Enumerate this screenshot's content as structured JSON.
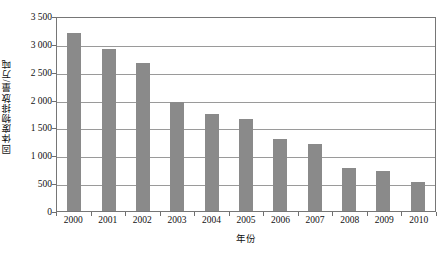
{
  "chart_data": {
    "type": "bar",
    "title": "",
    "xlabel": "年份",
    "ylabel": "固体废物排放量/万吨",
    "categories": [
      "2000",
      "2001",
      "2002",
      "2003",
      "2004",
      "2005",
      "2006",
      "2007",
      "2008",
      "2009",
      "2010"
    ],
    "values": [
      3200,
      2900,
      2650,
      1950,
      1750,
      1650,
      1300,
      1200,
      780,
      720,
      520
    ],
    "series": [
      {
        "name": "固体废物排放量",
        "values": [
          3200,
          2900,
          2650,
          1950,
          1750,
          1650,
          1300,
          1200,
          780,
          720,
          520
        ]
      }
    ],
    "ylim": [
      0,
      3500
    ],
    "ytick_values": [
      0,
      500,
      1000,
      1500,
      2000,
      2500,
      3000,
      3500
    ],
    "ytick_labels": [
      "0",
      "500",
      "1 000",
      "1 500",
      "2 000",
      "2 500",
      "3 000",
      "3 500"
    ],
    "grid": true,
    "grid_axis": "y",
    "legend": "none",
    "bar_color": "#8a8a8a",
    "axis_color": "#767676",
    "gridline_color": "#9a9a9a",
    "background_color": "#ffffff"
  },
  "axes": {
    "y_title": "固体废物排放量/万吨",
    "x_title": "年份"
  },
  "caption": ""
}
